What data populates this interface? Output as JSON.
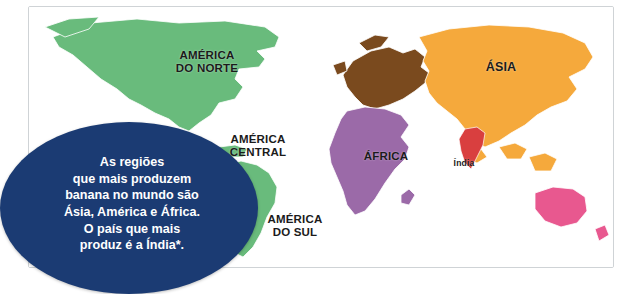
{
  "map": {
    "title_alt": "Mapa-múndi das regiões produtoras de banana",
    "labels": {
      "america_norte": "AMÉRICA\nDO NORTE",
      "america_central": "AMÉRICA\nCENTRAL",
      "america_sul": "AMÉRICA\nDO SUL",
      "africa": "ÁFRICA",
      "asia": "ÁSIA",
      "india": "Índia"
    },
    "colors": {
      "americas_green": "#69bb7c",
      "europe_brown": "#7a4a1e",
      "africa_purple": "#9b6aa8",
      "asia_orange": "#f5a93c",
      "oceania_pink": "#e8588f",
      "india_red": "#d93f3f",
      "ocean_white": "#ffffff",
      "border_gray": "#cfd3d6",
      "callout_blue": "#1b3b73"
    }
  },
  "callout": {
    "text": "As regiões\nque mais produzem\nbanana no mundo são\nÁsia, América e África.\nO país que mais\nproduz é a Índia*."
  }
}
